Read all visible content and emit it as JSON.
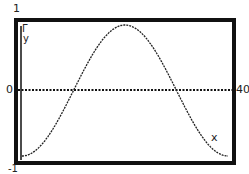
{
  "chart_data": {
    "type": "line",
    "title": "",
    "xlabel": "x",
    "ylabel": "y",
    "xlim": [
      0,
      40
    ],
    "ylim": [
      -1,
      1
    ],
    "tick_labels": {
      "y_top": "1",
      "y_mid": "0",
      "y_bottom": "-1",
      "x_right": "40"
    },
    "grid": false,
    "series": [
      {
        "name": "y = -cos(2πx/40)",
        "x": [
          0,
          5,
          10,
          15,
          20,
          25,
          30,
          35,
          40
        ],
        "y": [
          -1,
          -0.71,
          0,
          0.71,
          1,
          0.71,
          0,
          -0.71,
          -1
        ]
      }
    ]
  },
  "labels": {
    "y_max": "1",
    "y_zero": "0",
    "y_min": "-1",
    "x_max": "40",
    "x_axis": "x",
    "y_axis": "y",
    "cursor": "Γ"
  }
}
